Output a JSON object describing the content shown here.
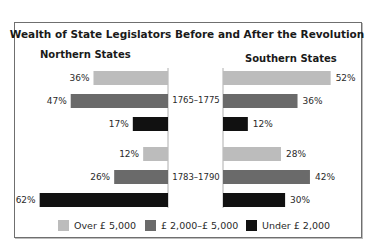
{
  "chart_data": {
    "type": "bar",
    "orientation": "horizontal",
    "title": "Wealth of State Legislators Before and After the Revolution",
    "panels": [
      {
        "name": "Northern States",
        "direction": "left",
        "groups": [
          {
            "period": "1765–1775",
            "values": [
              36,
              47,
              17
            ]
          },
          {
            "period": "1783–1790",
            "values": [
              12,
              26,
              62
            ]
          }
        ]
      },
      {
        "name": "Southern States",
        "direction": "right",
        "groups": [
          {
            "period": "1765–1775",
            "values": [
              52,
              36,
              12
            ]
          },
          {
            "period": "1783–1790",
            "values": [
              28,
              42,
              30
            ]
          }
        ]
      }
    ],
    "series": [
      {
        "name": "Over £ 5,000",
        "color": "#bcbcbc"
      },
      {
        "name": "£ 2,000–£ 5,000",
        "color": "#6a6a6a"
      },
      {
        "name": "Under £ 2,000",
        "color": "#111111"
      }
    ],
    "categories": [
      "1765–1775",
      "1783–1790"
    ],
    "value_suffix": "%",
    "xlim": [
      0,
      100
    ],
    "grid": false,
    "legend": "bottom"
  }
}
